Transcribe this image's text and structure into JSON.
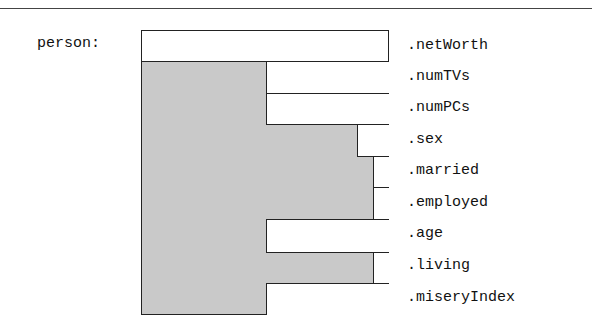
{
  "variable": {
    "label": "person:"
  },
  "record": {
    "fields": [
      {
        "name": ".netWorth",
        "top": 30,
        "height": 31,
        "left": 141
      },
      {
        "name": ".numTVs",
        "top": 61,
        "height": 32,
        "left": 266
      },
      {
        "name": ".numPCs",
        "top": 93,
        "height": 31,
        "left": 266
      },
      {
        "name": ".sex",
        "top": 124,
        "height": 32,
        "left": 357
      },
      {
        "name": ".married",
        "top": 156,
        "height": 31,
        "left": 373
      },
      {
        "name": ".employed",
        "top": 187,
        "height": 32,
        "left": 373
      },
      {
        "name": ".age",
        "top": 219,
        "height": 33,
        "left": 266
      },
      {
        "name": ".living",
        "top": 252,
        "height": 31,
        "left": 373
      },
      {
        "name": ".miseryIndex",
        "top": 283,
        "height": 32,
        "left": 266
      }
    ]
  },
  "colors": {
    "shade": "#c9c9c9",
    "border": "#222222",
    "fill": "#ffffff"
  }
}
